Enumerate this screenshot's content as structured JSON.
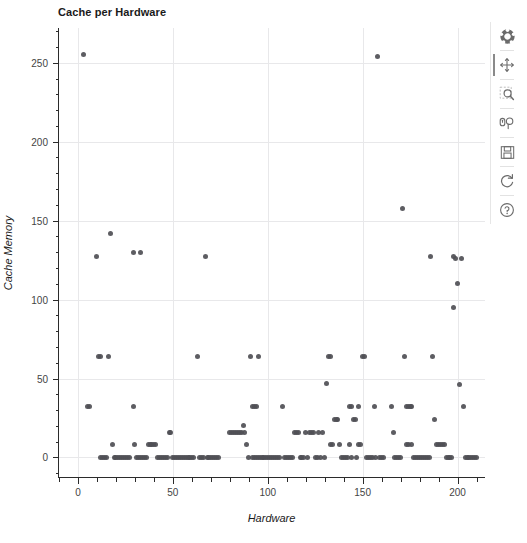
{
  "chart_data": {
    "type": "scatter",
    "title": "Cache per Hardware",
    "xlabel": "Hardware",
    "ylabel": "Cache Memory",
    "xlim": [
      -10,
      215
    ],
    "ylim": [
      -13,
      272
    ],
    "xticks": [
      0,
      50,
      100,
      150,
      200
    ],
    "yticks": [
      0,
      50,
      100,
      150,
      200,
      250
    ],
    "x_minor_step": 10,
    "y_minor_step": 10,
    "grid": true,
    "legend": "none",
    "marker": "circle",
    "marker_color": "#4f4f55",
    "marker_size": 5,
    "points": [
      [
        3,
        255
      ],
      [
        5,
        32
      ],
      [
        6,
        32
      ],
      [
        10,
        127
      ],
      [
        11,
        64
      ],
      [
        12,
        64
      ],
      [
        12,
        0
      ],
      [
        13,
        0
      ],
      [
        14,
        0
      ],
      [
        15,
        0
      ],
      [
        16,
        64
      ],
      [
        17,
        142
      ],
      [
        18,
        8
      ],
      [
        19,
        0
      ],
      [
        20,
        0
      ],
      [
        21,
        0
      ],
      [
        22,
        0
      ],
      [
        23,
        0
      ],
      [
        24,
        0
      ],
      [
        25,
        0
      ],
      [
        26,
        0
      ],
      [
        27,
        0
      ],
      [
        29,
        130
      ],
      [
        29,
        32
      ],
      [
        30,
        8
      ],
      [
        31,
        0
      ],
      [
        32,
        0
      ],
      [
        33,
        130
      ],
      [
        33,
        0
      ],
      [
        34,
        0
      ],
      [
        35,
        0
      ],
      [
        36,
        0
      ],
      [
        37,
        8
      ],
      [
        38,
        8
      ],
      [
        39,
        8
      ],
      [
        40,
        8
      ],
      [
        41,
        8
      ],
      [
        42,
        0
      ],
      [
        43,
        0
      ],
      [
        44,
        0
      ],
      [
        45,
        0
      ],
      [
        46,
        0
      ],
      [
        47,
        0
      ],
      [
        48,
        16
      ],
      [
        49,
        16
      ],
      [
        50,
        0
      ],
      [
        51,
        0
      ],
      [
        52,
        0
      ],
      [
        53,
        0
      ],
      [
        54,
        0
      ],
      [
        55,
        0
      ],
      [
        56,
        0
      ],
      [
        57,
        0
      ],
      [
        58,
        0
      ],
      [
        59,
        0
      ],
      [
        60,
        0
      ],
      [
        61,
        0
      ],
      [
        63,
        64
      ],
      [
        64,
        0
      ],
      [
        65,
        0
      ],
      [
        66,
        0
      ],
      [
        67,
        127
      ],
      [
        68,
        0
      ],
      [
        69,
        0
      ],
      [
        70,
        0
      ],
      [
        71,
        0
      ],
      [
        72,
        0
      ],
      [
        73,
        0
      ],
      [
        74,
        0
      ],
      [
        80,
        16
      ],
      [
        81,
        16
      ],
      [
        82,
        16
      ],
      [
        83,
        16
      ],
      [
        84,
        16
      ],
      [
        85,
        16
      ],
      [
        86,
        16
      ],
      [
        87,
        20
      ],
      [
        88,
        16
      ],
      [
        89,
        8
      ],
      [
        90,
        0
      ],
      [
        91,
        64
      ],
      [
        92,
        32
      ],
      [
        92,
        0
      ],
      [
        93,
        32
      ],
      [
        93,
        0
      ],
      [
        94,
        32
      ],
      [
        94,
        0
      ],
      [
        95,
        64
      ],
      [
        95,
        0
      ],
      [
        96,
        0
      ],
      [
        97,
        0
      ],
      [
        98,
        0
      ],
      [
        99,
        0
      ],
      [
        100,
        0
      ],
      [
        101,
        0
      ],
      [
        102,
        0
      ],
      [
        103,
        0
      ],
      [
        104,
        0
      ],
      [
        105,
        0
      ],
      [
        106,
        0
      ],
      [
        108,
        32
      ],
      [
        109,
        0
      ],
      [
        110,
        0
      ],
      [
        111,
        0
      ],
      [
        112,
        0
      ],
      [
        113,
        0
      ],
      [
        114,
        16
      ],
      [
        115,
        16
      ],
      [
        116,
        16
      ],
      [
        117,
        0
      ],
      [
        118,
        0
      ],
      [
        119,
        0
      ],
      [
        120,
        16
      ],
      [
        121,
        0
      ],
      [
        122,
        16
      ],
      [
        123,
        16
      ],
      [
        124,
        16
      ],
      [
        125,
        0
      ],
      [
        126,
        0
      ],
      [
        127,
        16
      ],
      [
        128,
        0
      ],
      [
        129,
        16
      ],
      [
        130,
        0
      ],
      [
        131,
        47
      ],
      [
        132,
        64
      ],
      [
        133,
        64
      ],
      [
        133,
        8
      ],
      [
        134,
        8
      ],
      [
        135,
        24
      ],
      [
        136,
        24
      ],
      [
        137,
        24
      ],
      [
        138,
        8
      ],
      [
        139,
        0
      ],
      [
        140,
        0
      ],
      [
        141,
        0
      ],
      [
        142,
        0
      ],
      [
        143,
        32
      ],
      [
        143,
        8
      ],
      [
        144,
        32
      ],
      [
        144,
        0
      ],
      [
        145,
        24
      ],
      [
        146,
        24
      ],
      [
        147,
        0
      ],
      [
        148,
        32
      ],
      [
        148,
        8
      ],
      [
        149,
        8
      ],
      [
        150,
        64
      ],
      [
        151,
        64
      ],
      [
        152,
        0
      ],
      [
        153,
        0
      ],
      [
        154,
        0
      ],
      [
        155,
        0
      ],
      [
        156,
        32
      ],
      [
        157,
        0
      ],
      [
        158,
        254
      ],
      [
        159,
        0
      ],
      [
        160,
        0
      ],
      [
        161,
        0
      ],
      [
        165,
        32
      ],
      [
        166,
        16
      ],
      [
        167,
        0
      ],
      [
        168,
        0
      ],
      [
        169,
        0
      ],
      [
        170,
        0
      ],
      [
        171,
        158
      ],
      [
        172,
        64
      ],
      [
        173,
        32
      ],
      [
        173,
        8
      ],
      [
        174,
        32
      ],
      [
        174,
        8
      ],
      [
        175,
        32
      ],
      [
        176,
        32
      ],
      [
        176,
        8
      ],
      [
        177,
        0
      ],
      [
        178,
        0
      ],
      [
        179,
        0
      ],
      [
        180,
        0
      ],
      [
        181,
        0
      ],
      [
        182,
        0
      ],
      [
        183,
        0
      ],
      [
        184,
        0
      ],
      [
        185,
        0
      ],
      [
        186,
        127
      ],
      [
        187,
        64
      ],
      [
        188,
        24
      ],
      [
        189,
        8
      ],
      [
        190,
        8
      ],
      [
        191,
        8
      ],
      [
        192,
        8
      ],
      [
        193,
        8
      ],
      [
        194,
        0
      ],
      [
        195,
        0
      ],
      [
        196,
        0
      ],
      [
        197,
        0
      ],
      [
        198,
        127
      ],
      [
        198,
        95
      ],
      [
        199,
        126
      ],
      [
        200,
        110
      ],
      [
        201,
        46
      ],
      [
        202,
        126
      ],
      [
        203,
        32
      ],
      [
        204,
        0
      ],
      [
        205,
        0
      ],
      [
        206,
        0
      ],
      [
        207,
        0
      ],
      [
        208,
        0
      ],
      [
        209,
        0
      ],
      [
        210,
        0
      ]
    ]
  },
  "toolbar": {
    "items": [
      {
        "name": "bokeh-logo-icon",
        "label": "Bokeh"
      },
      {
        "name": "pan-tool-icon",
        "label": "Pan"
      },
      {
        "name": "box-zoom-tool-icon",
        "label": "Box Zoom"
      },
      {
        "name": "wheel-zoom-tool-icon",
        "label": "Wheel Zoom"
      },
      {
        "name": "save-tool-icon",
        "label": "Save"
      },
      {
        "name": "reset-tool-icon",
        "label": "Reset"
      },
      {
        "name": "help-tool-icon",
        "label": "Help"
      }
    ]
  }
}
